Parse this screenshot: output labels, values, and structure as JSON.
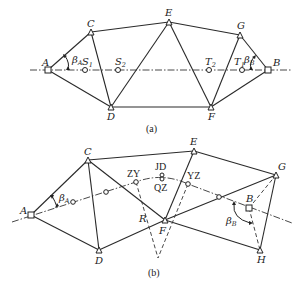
{
  "figure_a": {
    "caption": "(a)",
    "stations": {
      "A": "A",
      "B": "B",
      "C": "C",
      "D": "D",
      "E": "E",
      "F": "F",
      "G": "G"
    },
    "centerline_points": {
      "S1": {
        "main": "S",
        "sub": "1"
      },
      "S2": {
        "main": "S",
        "sub": "2"
      },
      "T1": {
        "main": "T",
        "sub": "1"
      },
      "T2": {
        "main": "T",
        "sub": "2"
      }
    },
    "angles": {
      "beta_A": {
        "main": "β",
        "sub": "A"
      },
      "beta_B": {
        "main": "β",
        "sub": "B"
      }
    }
  },
  "figure_b": {
    "caption": "(b)",
    "stations": {
      "A": "A",
      "B": "B",
      "C": "C",
      "D": "D",
      "E": "E",
      "F": "F",
      "G": "G",
      "H": "H"
    },
    "curve_points": {
      "ZY": "ZY",
      "JD": "JD",
      "QZ": "QZ",
      "YZ": "YZ"
    },
    "radius_label": "R",
    "angles": {
      "beta_A": {
        "main": "β",
        "sub": "A"
      },
      "beta_B": {
        "main": "β",
        "sub": "B"
      }
    }
  }
}
